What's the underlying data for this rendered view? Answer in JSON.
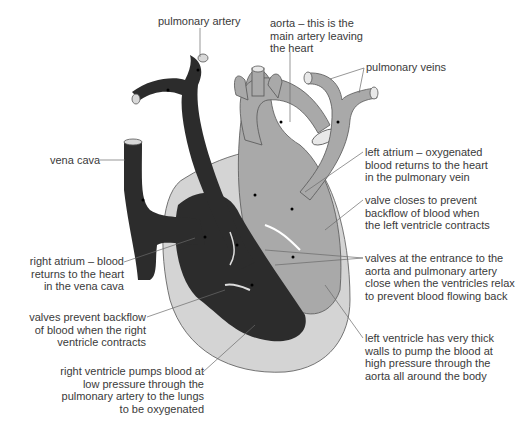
{
  "diagram": {
    "colors": {
      "deoxygenated": "#2c2c2c",
      "oxygenated": "#a9a9a9",
      "wall": "#d4d4d4",
      "leader_line": "#6a6a6a",
      "text": "#3a3a3a"
    },
    "labels": {
      "pulmonary_artery": "pulmonary artery",
      "aorta": "aorta – this is the\nmain artery leaving\nthe heart",
      "pulmonary_veins": "pulmonary veins",
      "vena_cava": "vena cava",
      "left_atrium": "left atrium – oxygenated\nblood returns to the heart\nin the pulmonary vein",
      "valve_left": "valve closes to prevent\nbackflow of blood when\nthe left ventricle contracts",
      "valves_semilunar": "valves at the entrance to the\naorta and pulmonary artery\nclose when the ventricles relax\nto prevent blood flowing back",
      "right_atrium": "right atrium –  blood\nreturns to the heart\nin the vena cava",
      "valves_right": "valves prevent backflow\nof blood when the right\nventricle contracts",
      "left_ventricle": "left ventricle has very thick\nwalls to pump the blood at\nhigh pressure through the\naorta all around the body",
      "right_ventricle": "right ventricle pumps blood at\nlow pressure through the\npulmonary artery to the lungs\nto be oxygenated"
    }
  }
}
